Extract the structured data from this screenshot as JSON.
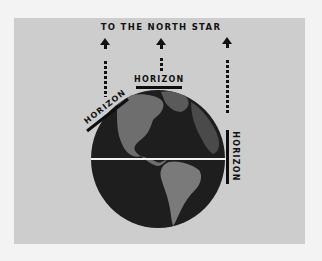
{
  "diagram": {
    "title": "TO THE NORTH STAR",
    "horizon_labels": {
      "left": "HORIZON",
      "top": "HORIZON",
      "right": "HORIZON"
    },
    "elements": {
      "arrows": [
        "north-star-arrow-left",
        "north-star-arrow-center",
        "north-star-arrow-right"
      ],
      "globe": "earth-globe-americas",
      "equator": "equator-line"
    },
    "colors": {
      "background": "#f3f3f3",
      "panel": "#cdcdcd",
      "ink": "#111111",
      "globe_ocean": "#1e1e1e",
      "globe_land": "#6e6e6e",
      "equator": "#f2f2f2"
    }
  }
}
